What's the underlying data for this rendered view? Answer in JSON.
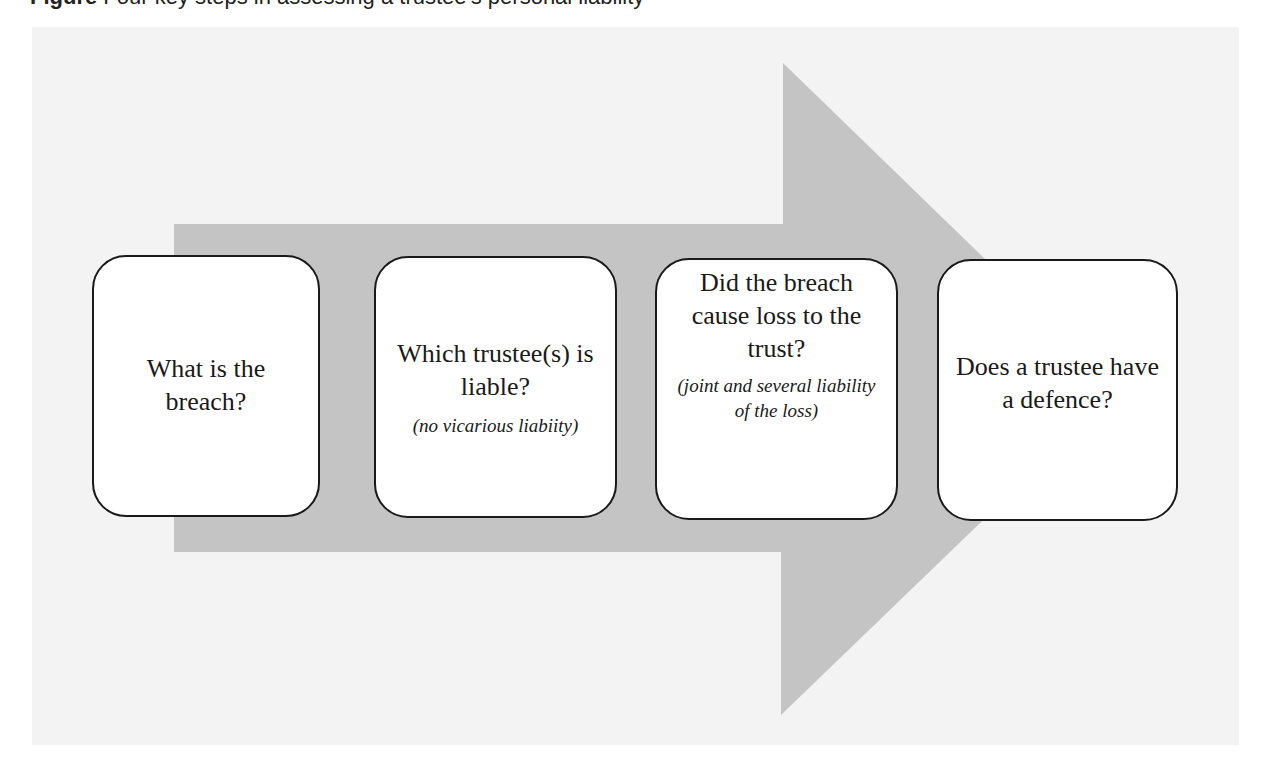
{
  "heading": {
    "label": "Figure",
    "text": "Four key steps in assessing a trustee's personal liability"
  },
  "colors": {
    "panel": "#f3f3f3",
    "arrow": "#c4c4c4",
    "box_fill": "#ffffff",
    "box_border": "#1a1a1a",
    "text": "#1a1a1a"
  },
  "diagram": {
    "type": "process-arrow",
    "steps": [
      {
        "title": "What is the breach?",
        "note": ""
      },
      {
        "title": "Which trustee(s) is liable?",
        "note": "(no vicarious liabiity)"
      },
      {
        "title": "Did the breach cause loss to the trust?",
        "note": "(joint and several liability of the loss)"
      },
      {
        "title": "Does a trustee have a defence?",
        "note": ""
      }
    ]
  }
}
